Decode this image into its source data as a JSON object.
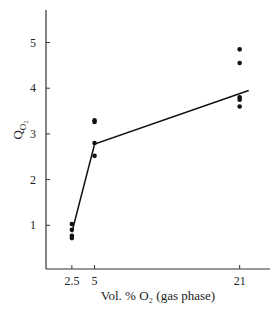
{
  "chart_data": {
    "type": "scatter",
    "title": "",
    "xlabel": "Vol. % O₂ (gas phase)",
    "ylabel": "Q_O2",
    "ylabel_main": "Q",
    "ylabel_sub": "O₂",
    "xlim": [
      0,
      24
    ],
    "ylim": [
      0,
      5.8
    ],
    "x_ticks": [
      2.5,
      5,
      21
    ],
    "x_tick_labels": [
      "2.5",
      "5",
      "21"
    ],
    "y_ticks": [
      1,
      2,
      3,
      4,
      5
    ],
    "y_tick_labels": [
      "1",
      "2",
      "3",
      "4",
      "5"
    ],
    "grid": false,
    "legend": null,
    "series": [
      {
        "name": "measurements",
        "kind": "points",
        "points": [
          {
            "x": 2.5,
            "y": 1.03
          },
          {
            "x": 2.5,
            "y": 0.9
          },
          {
            "x": 2.5,
            "y": 0.77
          },
          {
            "x": 2.5,
            "y": 0.72
          },
          {
            "x": 5,
            "y": 3.3
          },
          {
            "x": 5,
            "y": 3.26
          },
          {
            "x": 5,
            "y": 2.8
          },
          {
            "x": 5,
            "y": 2.52
          },
          {
            "x": 21,
            "y": 4.85
          },
          {
            "x": 21,
            "y": 4.55
          },
          {
            "x": 21,
            "y": 3.8
          },
          {
            "x": 21,
            "y": 3.75
          },
          {
            "x": 21,
            "y": 3.6
          }
        ]
      },
      {
        "name": "fitted line",
        "kind": "line",
        "points": [
          {
            "x": 2.5,
            "y": 0.85
          },
          {
            "x": 5,
            "y": 2.78
          },
          {
            "x": 22,
            "y": 3.95
          }
        ]
      }
    ]
  }
}
